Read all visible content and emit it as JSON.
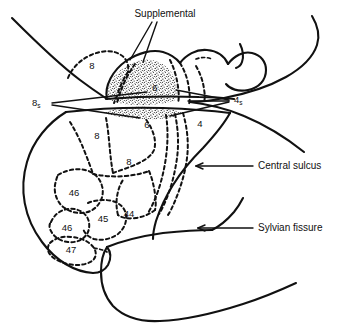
{
  "figure": {
    "type": "anatomical-diagram",
    "background_color": "#ffffff",
    "line_color": "#111111"
  },
  "callouts": [
    {
      "id": "supplemental",
      "label": "Supplemental",
      "x": 165,
      "y": 14,
      "anchor": "middle",
      "leader": "double-line-v"
    },
    {
      "id": "central-sulcus",
      "label": "Central sulcus",
      "x": 258,
      "y": 166,
      "anchor": "start",
      "leader": "arrow-left"
    },
    {
      "id": "sylvian-fissure",
      "label": "Sylvian fissure",
      "x": 258,
      "y": 228,
      "anchor": "start",
      "leader": "arrow-left"
    }
  ],
  "subscript_labels": [
    {
      "id": "eight-s",
      "base": "8",
      "sub": "s",
      "x": 40,
      "y": 103
    },
    {
      "id": "four-s",
      "base": "4",
      "sub": "s",
      "x": 234,
      "y": 100
    }
  ],
  "region_labels": [
    {
      "id": "area-8-superior",
      "text": "8",
      "x": 92,
      "y": 66
    },
    {
      "id": "area-6-medial",
      "text": "6",
      "x": 155,
      "y": 88
    },
    {
      "id": "area-6-lateral",
      "text": "6",
      "x": 147,
      "y": 125
    },
    {
      "id": "area-4",
      "text": "4",
      "x": 200,
      "y": 124
    },
    {
      "id": "area-8-mid",
      "text": "8",
      "x": 97,
      "y": 136
    },
    {
      "id": "area-8-lower",
      "text": "8",
      "x": 129,
      "y": 162
    },
    {
      "id": "area-46-upper",
      "text": "46",
      "x": 74,
      "y": 193
    },
    {
      "id": "area-46-lower",
      "text": "46",
      "x": 67,
      "y": 228
    },
    {
      "id": "area-45",
      "text": "45",
      "x": 103,
      "y": 219
    },
    {
      "id": "area-44",
      "text": "44",
      "x": 129,
      "y": 214
    },
    {
      "id": "area-47",
      "text": "47",
      "x": 71,
      "y": 250
    }
  ]
}
